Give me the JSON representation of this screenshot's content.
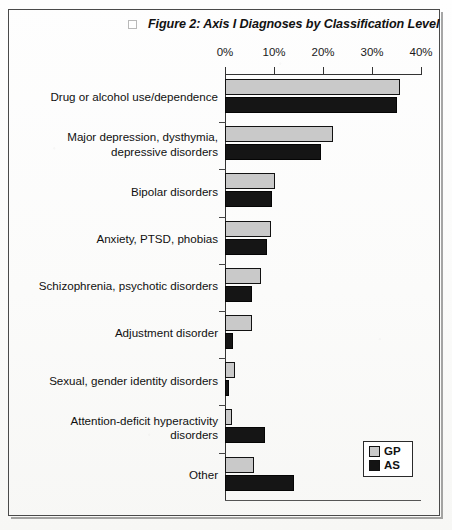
{
  "figure": {
    "title": "Figure 2: Axis I Diagnoses by Classification Level",
    "checkbox_state": "unchecked"
  },
  "legend": {
    "position": "bottom-right",
    "entries": [
      {
        "label": "GP",
        "color": "#c9c9c9"
      },
      {
        "label": "AS",
        "color": "#141414"
      }
    ]
  },
  "chart_data": {
    "type": "bar",
    "orientation": "horizontal",
    "title": "Figure 2: Axis I Diagnoses by Classification Level",
    "xlabel": "",
    "ylabel": "",
    "xlim": [
      0,
      40
    ],
    "grid": false,
    "x_tick_labels": [
      "0%",
      "10%",
      "20%",
      "30%",
      "40%"
    ],
    "x_ticks": [
      0,
      10,
      20,
      30,
      40
    ],
    "legend_position": "bottom-right",
    "categories": [
      "Drug or alcohol use/dependence",
      "Major depression, dysthymia, depressive disorders",
      "Bipolar disorders",
      "Anxiety, PTSD, phobias",
      "Schizophrenia, psychotic disorders",
      "Adjustment disorder",
      "Sexual, gender identity disorders",
      "Attention-deficit hyperactivity disorders",
      "Other"
    ],
    "series": [
      {
        "name": "GP",
        "color": "#c9c9c9",
        "values": [
          35.8,
          22.0,
          10.2,
          9.4,
          7.4,
          5.5,
          2.0,
          1.5,
          6.0
        ]
      },
      {
        "name": "AS",
        "color": "#141414",
        "values": [
          35.0,
          19.5,
          9.6,
          8.5,
          5.6,
          1.7,
          0.8,
          8.2,
          14.0
        ]
      }
    ]
  },
  "category_label_lines": [
    [
      "Drug or alcohol use/dependence"
    ],
    [
      "Major depression, dysthymia,",
      "depressive disorders"
    ],
    [
      "Bipolar disorders"
    ],
    [
      "Anxiety, PTSD, phobias"
    ],
    [
      "Schizophrenia, psychotic disorders"
    ],
    [
      "Adjustment disorder"
    ],
    [
      "Sexual, gender identity disorders"
    ],
    [
      "Attention-deficit hyperactivity",
      "disorders"
    ],
    [
      "Other"
    ]
  ]
}
